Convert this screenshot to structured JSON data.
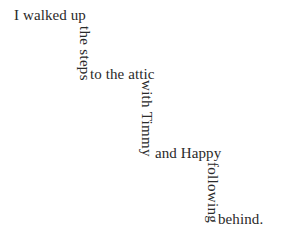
{
  "page": {
    "width": 288,
    "height": 235,
    "background_color": "#ffffff",
    "text_color": "#2a2a2a",
    "font_size_px": 15,
    "full_text": "I walked up the steps to the attic with Timmy and Happy following behind."
  },
  "segments": [
    {
      "id": "segment-1",
      "text": "I walked up",
      "orientation": "horizontal",
      "x": 14,
      "y": 8
    },
    {
      "id": "segment-2",
      "text": "the steps",
      "orientation": "vertical",
      "x": 77,
      "y": 26
    },
    {
      "id": "segment-3",
      "text": "to the attic",
      "orientation": "horizontal",
      "x": 90,
      "y": 67
    },
    {
      "id": "segment-4",
      "text": "with Timmy",
      "orientation": "vertical",
      "x": 139,
      "y": 80
    },
    {
      "id": "segment-5",
      "text": "and Happy",
      "orientation": "horizontal",
      "x": 155,
      "y": 146
    },
    {
      "id": "segment-6",
      "text": "following",
      "orientation": "vertical",
      "x": 205,
      "y": 162
    },
    {
      "id": "segment-7",
      "text": "behind.",
      "orientation": "horizontal",
      "x": 218,
      "y": 212
    }
  ]
}
